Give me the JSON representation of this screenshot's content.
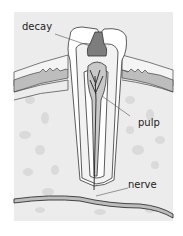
{
  "diagram": {
    "labels": {
      "decay": "decay",
      "pulp": "pulp",
      "nerve": "nerve"
    },
    "colors": {
      "background": "#ffffff",
      "frame": "#ececec",
      "bone_speckle": "#d4d4d4",
      "enamel": "#ffffff",
      "dentin": "#f2f2f2",
      "decay": "#7d7d7d",
      "pulp": "#c8c8c8",
      "gum": "#bdbdbd",
      "outline": "#333333"
    }
  }
}
